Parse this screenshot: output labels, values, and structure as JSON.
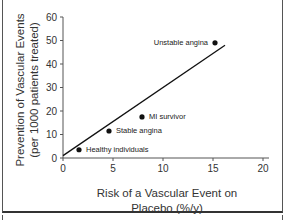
{
  "chart_data": {
    "type": "scatter",
    "title": "",
    "xlabel": "Risk of a Vascular Event on Placebo (%/y)",
    "xlabel_lines": [
      "Risk of a Vascular Event on",
      "Placebo (%/y)"
    ],
    "ylabel": "Prevention of Vascular Events (per 1000 patients treated)",
    "ylabel_lines": [
      "Prevention of Vascular Events",
      "(per 1000 patients treated)"
    ],
    "xlim": [
      0,
      20
    ],
    "ylim": [
      0,
      60
    ],
    "xticks": [
      0,
      5,
      10,
      15,
      20
    ],
    "yticks": [
      0,
      10,
      20,
      30,
      40,
      50,
      60
    ],
    "grid": false,
    "legend": null,
    "points": [
      {
        "label": "Healthy individuals",
        "x": 1.6,
        "y": 3.5
      },
      {
        "label": "Stable angina",
        "x": 4.6,
        "y": 11.5
      },
      {
        "label": "MI survivor",
        "x": 7.9,
        "y": 17.5
      },
      {
        "label": "Unstable angina",
        "x": 15.2,
        "y": 49
      }
    ],
    "trend_line": {
      "x": [
        0,
        16.2
      ],
      "y": [
        1,
        48
      ]
    },
    "colors": {
      "point": "#111111",
      "line": "#111111",
      "axis": "#555555"
    }
  }
}
